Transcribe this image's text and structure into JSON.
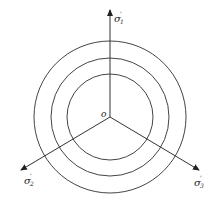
{
  "diagram": {
    "type": "deviatoric-plane",
    "center": {
      "x": 110,
      "y": 117
    },
    "origin_label": "o",
    "axes": [
      {
        "name": "sigma1",
        "label_main": "σ",
        "label_sup": "'",
        "label_sub": "1",
        "end": {
          "x": 110,
          "y": 8
        }
      },
      {
        "name": "sigma2",
        "label_main": "σ",
        "label_sup": "'",
        "label_sub": "2",
        "end": {
          "x": 20,
          "y": 172
        }
      },
      {
        "name": "sigma3",
        "label_main": "σ",
        "label_sup": "'",
        "label_sub": "3",
        "end": {
          "x": 200,
          "y": 172
        }
      }
    ],
    "circles": [
      {
        "name": "outer",
        "r": 76
      },
      {
        "name": "middle",
        "r": 59
      },
      {
        "name": "inner",
        "r": 43
      }
    ],
    "colors": {
      "line": "#333333",
      "background": "#ffffff"
    }
  }
}
